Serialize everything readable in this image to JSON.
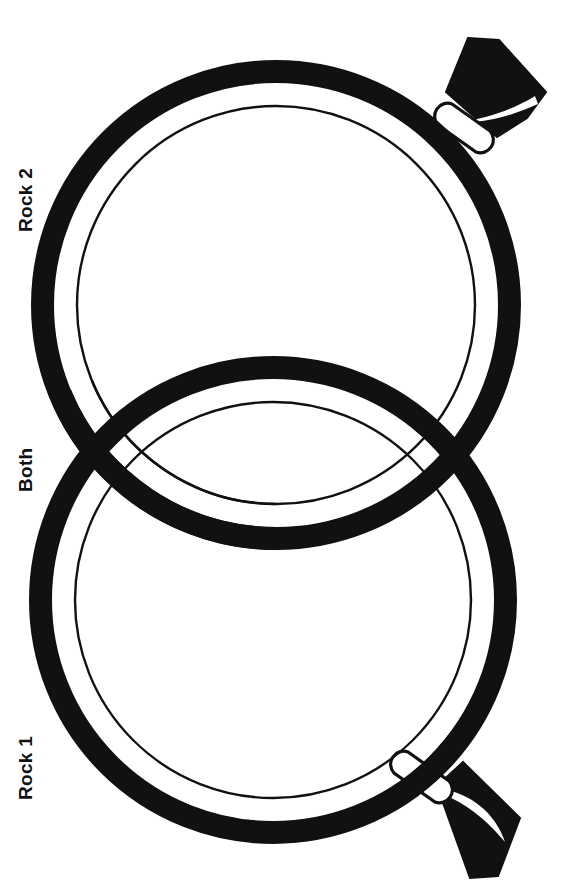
{
  "page": {
    "background_color": "#ffffff",
    "ink_color": "#111111",
    "width": 572,
    "height": 889
  },
  "labels": {
    "top": "Rock 2",
    "middle": "Both",
    "bottom": "Rock 1",
    "orientation": "rotated-90-ccw"
  },
  "diagram": {
    "type": "venn-two-set",
    "shape": "magnifying-glass",
    "stroke_color": "#111111",
    "fill_color": "#ffffff",
    "sets": [
      {
        "id": "rock2",
        "label": "Rock 2",
        "center_x": 276,
        "center_y": 305,
        "outer_radius": 244,
        "rim_thickness": 21,
        "lens_radius": 199,
        "handle_angle_deg": -42
      },
      {
        "id": "rock1",
        "label": "Rock 1",
        "center_x": 273,
        "center_y": 600,
        "outer_radius": 243,
        "rim_thickness": 21,
        "lens_radius": 198,
        "handle_angle_deg": 40
      }
    ],
    "intersection": {
      "label": "Both",
      "left_point_x": 78,
      "left_point_y": 468,
      "right_point_x": 470,
      "right_point_y": 452
    }
  },
  "icons": {
    "magnifier_top": "magnifying-glass-icon",
    "magnifier_bottom": "magnifying-glass-icon",
    "handle_top": "handle-icon",
    "handle_bottom": "handle-icon"
  }
}
